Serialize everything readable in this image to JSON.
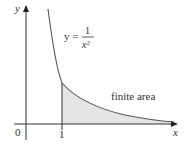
{
  "diagram": {
    "equation": {
      "lhs": "y =",
      "numerator": "1",
      "denominator": "x²"
    },
    "region_label": "finite area",
    "axes": {
      "x_label": "x",
      "y_label": "y",
      "origin_label": "0",
      "tick_label": "1"
    },
    "colors": {
      "curve": "#555555",
      "axis": "#333333",
      "fill": "#e6e6e6"
    }
  }
}
